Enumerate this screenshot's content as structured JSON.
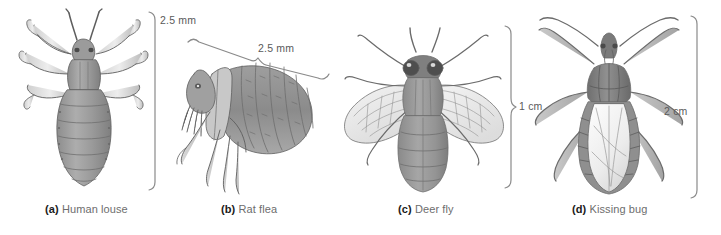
{
  "figure": {
    "background": "#ffffff",
    "ink": "#6d6d6d",
    "label_color": "#1a1a1a"
  },
  "panels": [
    {
      "key": "a",
      "letter": "(a)",
      "name": "Human louse",
      "scale": "2.5 mm",
      "scale_orientation": "vertical",
      "art": "human-louse-dorsal-illustration"
    },
    {
      "key": "b",
      "letter": "(b)",
      "name": "Rat flea",
      "scale": "2.5 mm",
      "scale_orientation": "diagonal",
      "art": "rat-flea-lateral-illustration"
    },
    {
      "key": "c",
      "letter": "(c)",
      "name": "Deer fly",
      "scale": "1 cm",
      "scale_orientation": "vertical",
      "art": "deer-fly-dorsal-illustration"
    },
    {
      "key": "d",
      "letter": "(d)",
      "name": "Kissing bug",
      "scale": "2 cm",
      "scale_orientation": "vertical",
      "art": "kissing-bug-dorsal-illustration"
    }
  ]
}
